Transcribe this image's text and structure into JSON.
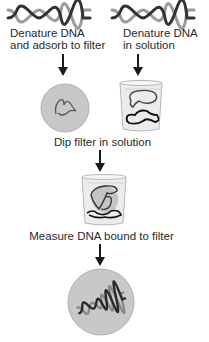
{
  "diagram": {
    "type": "flowchart",
    "steps": {
      "left_branch": {
        "line1": "Denature DNA",
        "line2": "and adsorb to filter"
      },
      "right_branch": {
        "line1": "Denature DNA",
        "line2": "in solution"
      },
      "merge": "Dip filter in solution",
      "measure": "Measure DNA bound to filter"
    },
    "icons": {
      "top_left": "dna-double-helix-icon",
      "top_right": "dna-double-helix-icon",
      "filter": "filter-disc-single-strand-icon",
      "beaker_solution": "beaker-single-strands-icon",
      "beaker_with_filter": "beaker-filter-icon",
      "result": "filter-disc-double-helix-icon"
    },
    "colors": {
      "filter_disc": "#c8c8c8",
      "beaker_glass": "#e6e6e6",
      "strand_dark": "#2a2a2a",
      "arrow": "#1a1a1a"
    }
  }
}
